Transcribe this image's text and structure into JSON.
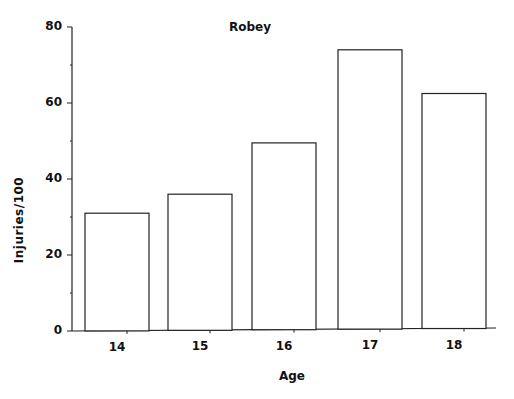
{
  "chart_data": {
    "type": "bar",
    "title": "Robey",
    "xlabel": "Age",
    "ylabel": "Injuries/100",
    "categories": [
      "14",
      "15",
      "16",
      "17",
      "18"
    ],
    "values": [
      31,
      36,
      49.5,
      74,
      62.5
    ],
    "ylim": [
      0,
      80
    ],
    "yticks": [
      "0",
      "20",
      "40",
      "60",
      "80"
    ],
    "minor_yticks": [
      10,
      30,
      50,
      70
    ],
    "grid": false,
    "legend": null,
    "bar_fill": "#ffffff",
    "bar_stroke": "#222222"
  }
}
